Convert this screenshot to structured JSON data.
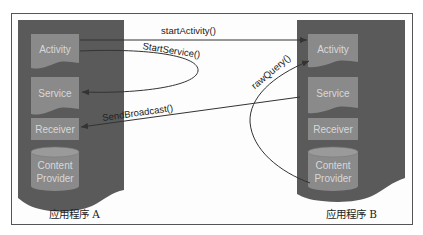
{
  "diagram": {
    "type": "inter-app communication",
    "colors": {
      "panel": "#5a5a5a",
      "component": "#8a8a8a",
      "component_text": "#dcdcdc",
      "arrow": "#333333",
      "frame_border": "#555555"
    },
    "apps": [
      {
        "id": "A",
        "label": "应用程序 A",
        "components": {
          "activity": "Activity",
          "service": "Service",
          "receiver": "Receiver",
          "provider_line1": "Content",
          "provider_line2": "Provider"
        }
      },
      {
        "id": "B",
        "label": "应用程序 B",
        "components": {
          "activity": "Activity",
          "service": "Service",
          "receiver": "Receiver",
          "provider_line1": "Content",
          "provider_line2": "Provider"
        }
      }
    ],
    "calls": {
      "start_activity": "startActivity()",
      "start_service": "StartService()",
      "send_broadcast": "SendBroadcast()",
      "raw_query": "rawQuery()"
    },
    "edges": [
      {
        "label": "startActivity()",
        "from": "A.Activity",
        "to": "B.Activity"
      },
      {
        "label": "StartService()",
        "from": "A.Activity",
        "to": "A.Service"
      },
      {
        "label": "SendBroadcast()",
        "from": "B.Service",
        "to": "A.Receiver"
      },
      {
        "label": "rawQuery()",
        "from": "B.ContentProvider",
        "to": "B.Activity"
      }
    ]
  }
}
